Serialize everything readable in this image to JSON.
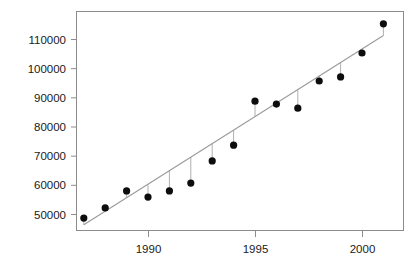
{
  "chart_data": {
    "type": "scatter",
    "title": "",
    "subtitle": "",
    "xlabel": "",
    "ylabel": "",
    "x": [
      1987,
      1988,
      1989,
      1990,
      1991,
      1992,
      1993,
      1994,
      1995,
      1996,
      1997,
      1998,
      1999,
      2000,
      2001
    ],
    "values": [
      48600,
      52100,
      57900,
      55800,
      57900,
      60600,
      68200,
      73600,
      88700,
      87700,
      86300,
      95600,
      97000,
      105200,
      115200
    ],
    "series": [
      {
        "name": "observed",
        "values": [
          48600,
          52100,
          57900,
          55800,
          57900,
          60600,
          68200,
          73600,
          88700,
          87700,
          86300,
          95600,
          97000,
          105200,
          115200
        ]
      },
      {
        "name": "fitted-regression-line",
        "values": [
          46300,
          50900,
          55600,
          60200,
          64800,
          69500,
          74100,
          78700,
          83400,
          88000,
          92600,
          97300,
          101900,
          106500,
          111200
        ]
      }
    ],
    "xlim": [
      1986.55,
      1988.0
    ],
    "ylim": [
      45900,
      116500
    ],
    "xticks": [
      1990,
      1995,
      2000
    ],
    "xtick_labels": [
      "1990",
      "1995",
      "2000"
    ],
    "yticks": [
      50000,
      60000,
      70000,
      80000,
      90000,
      100000,
      110000
    ],
    "ytick_labels": [
      "50000",
      "60000",
      "70000",
      "80000",
      "90000",
      "100000",
      "110000"
    ],
    "grid": false,
    "legend": null,
    "legend_position": "none",
    "annotations": [],
    "marker": "filled-circle",
    "has_regression_line": true,
    "has_residual_stems": true,
    "colors": {
      "point": "#0d0d0d",
      "regression_line": "#9a9a9a",
      "residual_stem": "#b0b0b0",
      "frame": "#8c8c8c",
      "tick_label": "#1a1a1a",
      "background": "#ffffff"
    }
  },
  "geometry": {
    "plot_left": 76,
    "plot_right": 404,
    "plot_top": 11,
    "plot_bottom": 231
  }
}
